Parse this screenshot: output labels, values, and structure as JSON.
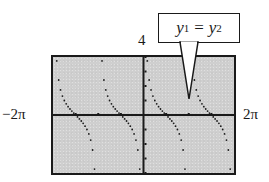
{
  "chart_data": {
    "type": "scatter",
    "title": "",
    "function": "cot(x)",
    "plot_mode": "dot",
    "xlim": [
      -6.2832,
      6.2832
    ],
    "ylim": [
      -4,
      4
    ],
    "xlabel": "",
    "ylabel": "",
    "x_tick_labels": {
      "min": "−2π",
      "max": "2π"
    },
    "y_tick_labels": {
      "max": "4"
    },
    "x_ticks": [
      -4.7124,
      -3.1416,
      -1.5708,
      0,
      1.5708,
      3.1416,
      4.7124
    ],
    "y_ticks": [
      -4,
      -3,
      -2,
      -1,
      0,
      1,
      2,
      3,
      4
    ],
    "grid": false,
    "legend": null,
    "asymptotes": [
      -6.2832,
      -3.1416,
      0,
      3.1416,
      6.2832
    ],
    "zeros": [
      -4.7124,
      -1.5708,
      1.5708,
      4.7124
    ],
    "sample_points_per_branch": 24,
    "annotation": {
      "text_parts": [
        "y",
        "1",
        "=",
        "y",
        "2"
      ],
      "meaning": "y1 = y2"
    }
  },
  "labels": {
    "xmin": "−2π",
    "xmax": "2π",
    "ymax": "4"
  },
  "callout": {
    "var1": "y",
    "sub1": "1",
    "eq": "=",
    "var2": "y",
    "sub2": "2"
  },
  "colors": {
    "screen_bg": "#cfcfcf",
    "ink": "#1a1a1a"
  }
}
